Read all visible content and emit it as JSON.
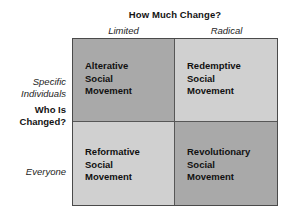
{
  "figure": {
    "column_axis_title": "How Much Change?",
    "row_axis_title_line1": "Who Is",
    "row_axis_title_line2": "Changed?",
    "columns": [
      {
        "label": "Limited"
      },
      {
        "label": "Radical"
      }
    ],
    "rows": [
      {
        "label_line1": "Specific",
        "label_line2": "Individuals"
      },
      {
        "label_line1": "Everyone",
        "label_line2": ""
      }
    ],
    "cells": [
      {
        "id": "alterative",
        "line1": "Alterative",
        "line2": "Social",
        "line3": "Movement",
        "shade": "dark",
        "fill": "#a9a9a9"
      },
      {
        "id": "redemptive",
        "line1": "Redemptive",
        "line2": "Social",
        "line3": "Movement",
        "shade": "light",
        "fill": "#d0d0d0"
      },
      {
        "id": "reformative",
        "line1": "Reformative",
        "line2": "Social",
        "line3": "Movement",
        "shade": "light",
        "fill": "#d0d0d0"
      },
      {
        "id": "revolutionary",
        "line1": "Revolutionary",
        "line2": "Social",
        "line3": "Movement",
        "shade": "dark",
        "fill": "#a9a9a9"
      }
    ],
    "colors": {
      "background": "#ffffff",
      "border": "#4a4a4a",
      "divider": "#575757",
      "text": "#111111"
    }
  },
  "chart_data": {
    "type": "table",
    "xlabel": "How Much Change?",
    "ylabel": "Who Is Changed?",
    "categories": [
      "Limited",
      "Radical"
    ],
    "row_categories": [
      "Specific Individuals",
      "Everyone"
    ],
    "cells": [
      [
        "Alterative Social Movement",
        "Redemptive Social Movement"
      ],
      [
        "Reformative Social Movement",
        "Revolutionary Social Movement"
      ]
    ],
    "grid": true,
    "legend": "none"
  }
}
